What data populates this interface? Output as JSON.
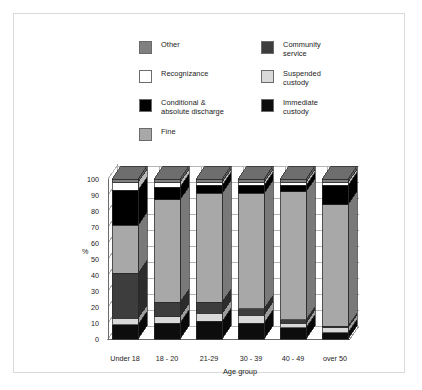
{
  "legend": {
    "left_column": [
      {
        "label": "Other",
        "key": "other",
        "color": "#808080"
      },
      {
        "label": "Recognizance",
        "key": "recognizance",
        "color": "#ffffff"
      },
      {
        "label": "Conditional &\nabsolute discharge",
        "key": "conditional",
        "color": "#000000"
      },
      {
        "label": "Fine",
        "key": "fine",
        "color": "#a8a8a8"
      }
    ],
    "right_column": [
      {
        "label": "Community\nservice",
        "key": "community",
        "color": "#3d3d3d"
      },
      {
        "label": "Suspended\ncustody",
        "key": "suspended",
        "color": "#d9d9d9"
      },
      {
        "label": "Immediate\ncustody",
        "key": "immediate",
        "color": "#0d0d0d"
      }
    ]
  },
  "chart_data": {
    "type": "bar",
    "subtype": "stacked-100-percent-3d",
    "title": "",
    "xlabel": "Age group",
    "ylabel": "%",
    "ylim": [
      0,
      100
    ],
    "yticks": [
      0,
      10,
      20,
      30,
      40,
      50,
      60,
      70,
      80,
      90,
      100
    ],
    "grid": true,
    "legend_position": "top",
    "categories": [
      "Under 18",
      "18 - 20",
      "21-29",
      "30 - 39",
      "40 - 49",
      "over 50"
    ],
    "stack_order_bottom_to_top": [
      "Immediate custody",
      "Suspended custody",
      "Community service",
      "Fine",
      "Conditional & absolute discharge",
      "Recognizance",
      "Other"
    ],
    "series": [
      {
        "name": "Immediate custody",
        "color": "#0d0d0d",
        "values": [
          9,
          10,
          11,
          10,
          7,
          4
        ]
      },
      {
        "name": "Suspended custody",
        "color": "#d9d9d9",
        "values": [
          4,
          4,
          5,
          5,
          3,
          3
        ]
      },
      {
        "name": "Community service",
        "color": "#3d3d3d",
        "values": [
          28,
          9,
          7,
          4,
          2,
          1
        ]
      },
      {
        "name": "Fine",
        "color": "#a8a8a8",
        "values": [
          30,
          64,
          68,
          72,
          80,
          76
        ]
      },
      {
        "name": "Conditional & absolute discharge",
        "color": "#000000",
        "values": [
          22,
          8,
          5,
          5,
          4,
          12
        ]
      },
      {
        "name": "Recognizance",
        "color": "#ffffff",
        "values": [
          5,
          3,
          2,
          2,
          2,
          2
        ]
      },
      {
        "name": "Other",
        "color": "#808080",
        "values": [
          2,
          2,
          2,
          2,
          2,
          2
        ]
      }
    ]
  },
  "axis": {
    "y_title": "%",
    "x_title": "Age group",
    "y_tick_labels": [
      "0",
      "10",
      "20",
      "30",
      "40",
      "50",
      "60",
      "70",
      "80",
      "90",
      "100"
    ]
  }
}
